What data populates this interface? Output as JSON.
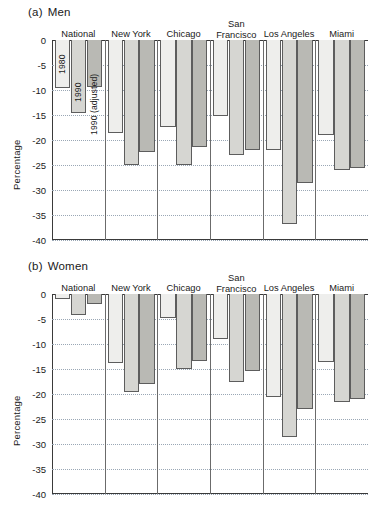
{
  "figure": {
    "panels": [
      {
        "tag": "(a)",
        "title": "Men"
      },
      {
        "tag": "(b)",
        "title": "Women"
      }
    ],
    "ylabel": "Percentage"
  },
  "chart_data": [
    {
      "type": "bar",
      "title": "Men",
      "panel_tag": "(a)",
      "xlabel": "",
      "ylabel": "Percentage",
      "ylim": [
        -40,
        0
      ],
      "ytick_labels": [
        "0",
        "-5",
        "-10",
        "-15",
        "-20",
        "-25",
        "-30",
        "-35",
        "-40"
      ],
      "yticks": [
        0,
        -5,
        -10,
        -15,
        -20,
        -25,
        -30,
        -35,
        -40
      ],
      "grid": true,
      "legend_position": "inside-first-group-rotated",
      "categories": [
        "National",
        "New York",
        "Chicago",
        "San Francisco",
        "Los Angeles",
        "Miami"
      ],
      "series": [
        {
          "name": "1980",
          "values": [
            -9.5,
            -18.6,
            -17.3,
            -15.2,
            -22.0,
            -19.0
          ]
        },
        {
          "name": "1990",
          "values": [
            -14.6,
            -25.0,
            -25.0,
            -23.0,
            -36.8,
            -26.0
          ]
        },
        {
          "name": "1990 (adjusted)",
          "values": [
            -9.3,
            -22.3,
            -21.3,
            -22.0,
            -28.6,
            -25.5
          ]
        }
      ]
    },
    {
      "type": "bar",
      "title": "Women",
      "panel_tag": "(b)",
      "xlabel": "",
      "ylabel": "Percentage",
      "ylim": [
        -40,
        0
      ],
      "ytick_labels": [
        "0",
        "-5",
        "-10",
        "-15",
        "-20",
        "-25",
        "-30",
        "-35",
        "-40"
      ],
      "yticks": [
        0,
        -5,
        -10,
        -15,
        -20,
        -25,
        -30,
        -35,
        -40
      ],
      "grid": true,
      "legend_position": "none",
      "categories": [
        "National",
        "New York",
        "Chicago",
        "San Francisco",
        "Los Angeles",
        "Miami"
      ],
      "series": [
        {
          "name": "1980",
          "values": [
            -1.0,
            -13.7,
            -4.8,
            -9.0,
            -20.5,
            -13.5
          ]
        },
        {
          "name": "1990",
          "values": [
            -4.1,
            -19.5,
            -15.0,
            -17.5,
            -28.6,
            -21.5
          ]
        },
        {
          "name": "1990 (adjusted)",
          "values": [
            -2.0,
            -18.0,
            -13.3,
            -15.4,
            -23.0,
            -21.0
          ]
        }
      ]
    }
  ]
}
